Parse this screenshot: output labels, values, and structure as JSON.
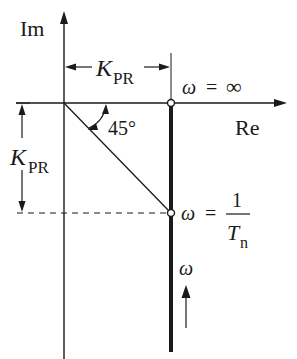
{
  "diagram": {
    "type": "nyquist-locus",
    "axes": {
      "imaginary_label": "Im",
      "real_label": "Re"
    },
    "dimensions": {
      "horizontal": {
        "symbol": "K",
        "subscript": "PR"
      },
      "vertical": {
        "symbol": "K",
        "subscript": "PR"
      }
    },
    "angle_label": "45°",
    "points": [
      {
        "name": "omega-infinity",
        "label_var": "ω",
        "label_eq": "=",
        "label_value": "∞"
      },
      {
        "name": "omega-corner",
        "label_var": "ω",
        "label_eq": "=",
        "numerator": "1",
        "denominator_symbol": "T",
        "denominator_subscript": "n"
      }
    ],
    "direction_label": "ω",
    "colors": {
      "line": "#1a1a1a",
      "background": "#ffffff"
    }
  }
}
